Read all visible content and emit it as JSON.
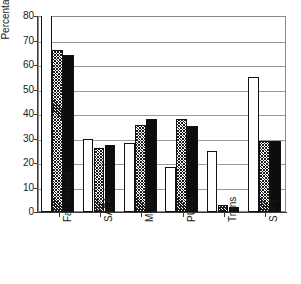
{
  "chart_data": {
    "type": "bar",
    "title": "",
    "xlabel": "",
    "ylabel": "Percentage",
    "ylim": [
      0,
      80
    ],
    "yticks": [
      0,
      10,
      20,
      30,
      40,
      50,
      60,
      70,
      80
    ],
    "grid": true,
    "legend_position": "none",
    "categories": [
      "Fat content",
      "SAFA",
      "MUFA",
      "PUFA",
      "Trans",
      "S + T"
    ],
    "series": [
      {
        "name": "series-1-open",
        "fill": "white-open",
        "values": [
          80,
          30,
          28,
          18.5,
          25,
          55
        ]
      },
      {
        "name": "series-2-hatched",
        "fill": "black-crosshatch",
        "values": [
          66,
          26,
          35.5,
          38,
          3,
          29
        ]
      },
      {
        "name": "series-3-solid",
        "fill": "black-solid",
        "values": [
          64,
          27.5,
          38,
          35,
          2,
          29
        ]
      }
    ],
    "annotations": [],
    "colors": {
      "axis": "#3a3a3a",
      "grid": "#9a9a9a",
      "bar_edge": "#111111",
      "bar_open": "#ffffff",
      "bar_solid": "#0d0d0d",
      "text": "#1a1a1a"
    }
  },
  "axis": {
    "y_title": "Percentage",
    "y_tick_labels": [
      "80",
      "70",
      "60",
      "50",
      "40",
      "30",
      "20",
      "10",
      "0"
    ],
    "x_tick_labels": [
      "Fat content",
      "SAFA",
      "MUFA",
      "PUFA",
      "Trans",
      "S + T"
    ]
  }
}
